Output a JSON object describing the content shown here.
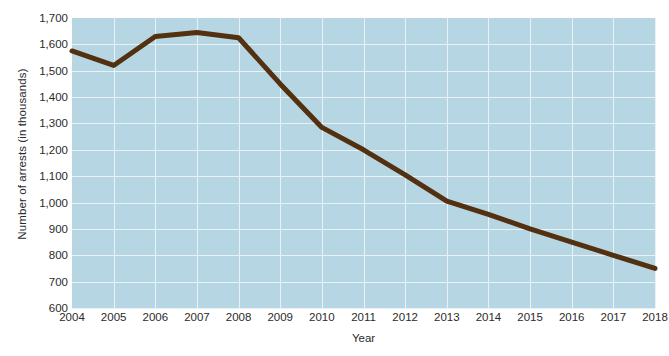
{
  "chart_data": {
    "type": "line",
    "title": "",
    "xlabel": "Year",
    "ylabel": "Number of arrests (in thousands)",
    "x": [
      2004,
      2005,
      2006,
      2007,
      2008,
      2009,
      2010,
      2011,
      2012,
      2013,
      2014,
      2015,
      2016,
      2017,
      2018
    ],
    "categories": [
      "2004",
      "2005",
      "2006",
      "2007",
      "2008",
      "2009",
      "2010",
      "2011",
      "2012",
      "2013",
      "2014",
      "2015",
      "2016",
      "2017",
      "2018"
    ],
    "values": [
      1575,
      1520,
      1630,
      1645,
      1625,
      1450,
      1285,
      1200,
      1105,
      1005,
      955,
      900,
      850,
      800,
      750
    ],
    "series": [
      {
        "name": "Number of arrests",
        "values": [
          1575,
          1520,
          1630,
          1645,
          1625,
          1450,
          1285,
          1200,
          1105,
          1005,
          955,
          900,
          850,
          800,
          750
        ],
        "color": "#53300f"
      }
    ],
    "xlim": [
      2004,
      2018
    ],
    "ylim": [
      600,
      1700
    ],
    "ytick_labels": [
      "1,700",
      "1,600",
      "1,500",
      "1,400",
      "1,300",
      "1,200",
      "1,100",
      "1,000",
      "900",
      "800",
      "700",
      "600"
    ],
    "ytick_values": [
      1700,
      1600,
      1500,
      1400,
      1300,
      1200,
      1100,
      1000,
      900,
      800,
      700,
      600
    ],
    "grid": true,
    "grid_color": "#e8f2f6",
    "plot_background": "#b6d6e3",
    "legend": "none",
    "legend_position": "none"
  }
}
